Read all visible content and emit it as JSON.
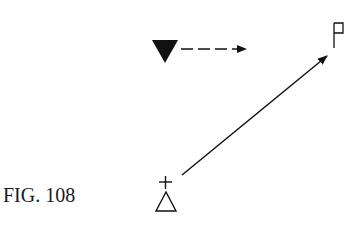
{
  "figure": {
    "label": "FIG. 108",
    "ink_color": "#111111",
    "elements": {
      "filled_triangle": "downward-pointing solid triangle",
      "dashed_arrow": "dashed arrow pointing right",
      "flag": "flag symbol",
      "diagonal_arrow": "solid arrow from lower left up to flag",
      "plus": "plus sign",
      "open_triangle": "upward-pointing outline triangle"
    }
  }
}
